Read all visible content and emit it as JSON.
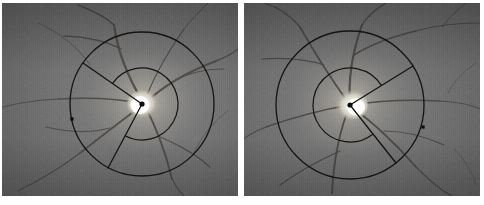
{
  "figure": {
    "kind": "retinal-fundus-angle-measurement",
    "width": 484,
    "height": 205,
    "background_color": "#ffffff",
    "panel_count": 2,
    "annotation_color": "#141414",
    "marker_color": "#101010"
  },
  "panels": [
    {
      "id": "left",
      "label": "",
      "x": 2,
      "y": 3,
      "width": 236,
      "height": 193,
      "image": {
        "type": "fundus-photograph",
        "modality": "color-fundus-grayscale",
        "base_color": "#6d6d6d",
        "disc_highlight_color": "#f2f0e8",
        "rim_color": "#b9b5a8",
        "vessel_color": "#4a4440"
      },
      "overlay": {
        "circle": {
          "cx": 140,
          "cy": 101,
          "r": 72,
          "stroke": "#141414",
          "stroke_width": 1.3
        },
        "vertex": {
          "x": 140,
          "y": 101,
          "radius": 2.6,
          "fill": "#0d0d0d"
        },
        "rays": [
          {
            "name": "ray-superior",
            "angle_deg": 145,
            "to_x": 81,
            "to_y": 60
          },
          {
            "name": "ray-inferior",
            "angle_deg": 242,
            "to_x": 106,
            "to_y": 165
          }
        ],
        "arc": {
          "radius": 36,
          "start_deg": 145,
          "end_deg": 242,
          "stroke": "#141414"
        },
        "boundary_marker": {
          "x": 70,
          "y": 116,
          "size": 3.2,
          "fill": "#0d0d0d"
        }
      }
    },
    {
      "id": "right",
      "label": "",
      "x": 244,
      "y": 3,
      "width": 236,
      "height": 193,
      "image": {
        "type": "fundus-photograph",
        "modality": "color-fundus-grayscale",
        "base_color": "#6a6a6a",
        "disc_highlight_color": "#f4f2ea",
        "rim_color": "#bdb9ac",
        "vessel_color": "#474140"
      },
      "overlay": {
        "circle": {
          "cx": 106,
          "cy": 102,
          "r": 74,
          "stroke": "#141414",
          "stroke_width": 1.3
        },
        "vertex": {
          "x": 106,
          "y": 102,
          "radius": 2.6,
          "fill": "#0d0d0d"
        },
        "rays": [
          {
            "name": "ray-superior",
            "angle_deg": 32,
            "to_x": 169,
            "to_y": 63
          },
          {
            "name": "ray-inferior",
            "angle_deg": 308,
            "to_x": 152,
            "to_y": 160
          }
        ],
        "arc": {
          "radius": 37,
          "start_deg": 308,
          "end_deg": 32,
          "stroke": "#141414"
        },
        "boundary_marker": {
          "x": 179,
          "y": 124,
          "size": 3.2,
          "fill": "#0d0d0d"
        }
      }
    }
  ]
}
